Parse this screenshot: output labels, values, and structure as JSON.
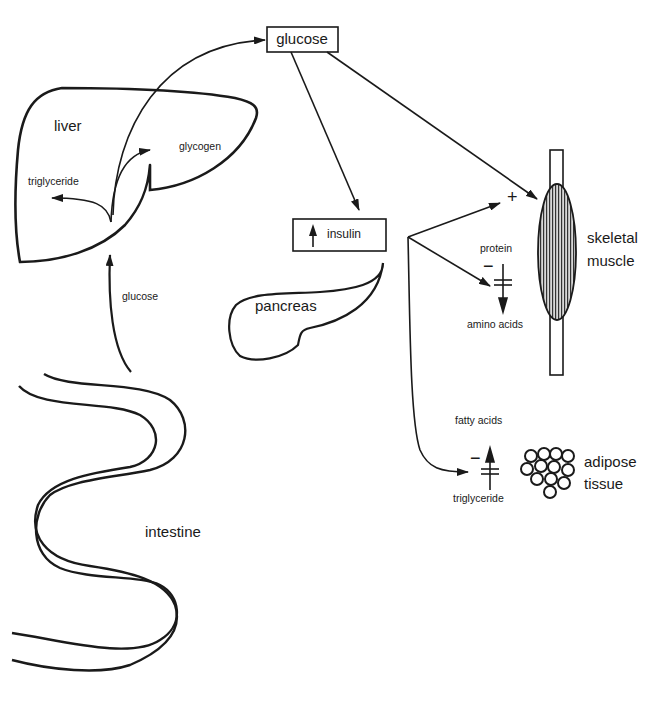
{
  "organs": {
    "liver": "liver",
    "pancreas": "pancreas",
    "intestine": "intestine",
    "muscle_line1": "skeletal",
    "muscle_line2": "muscle",
    "adipose_line1": "adipose",
    "adipose_line2": "tissue"
  },
  "boxes": {
    "glucose": "glucose",
    "insulin": "insulin",
    "insulin_arrow_icon": "up-arrow-icon"
  },
  "liver_products": {
    "glycogen": "glycogen",
    "triglyceride": "triglyceride"
  },
  "intestine_flow": {
    "glucose": "glucose"
  },
  "muscle_effects": {
    "uptake_sign": "+",
    "protein": "protein",
    "amino_acids": "amino acids",
    "inhibit_sign": "−"
  },
  "adipose_effects": {
    "fatty_acids": "fatty acids",
    "triglyceride": "triglyceride",
    "inhibit_sign": "−"
  },
  "colors": {
    "line": "#1a1a1a",
    "background": "#ffffff",
    "muscle_fill": "#8a8a8a"
  }
}
